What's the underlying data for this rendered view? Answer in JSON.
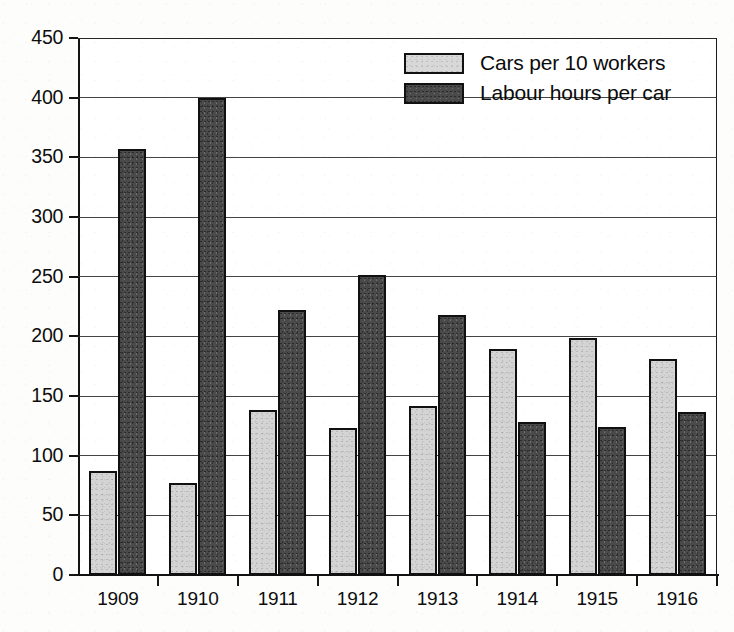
{
  "chart_data": {
    "type": "bar",
    "title": "",
    "subtitle": "",
    "xlabel": "",
    "ylabel": "",
    "categories": [
      "1909",
      "1910",
      "1911",
      "1912",
      "1913",
      "1914",
      "1915",
      "1916"
    ],
    "series": [
      {
        "name": "Cars per 10 workers",
        "color": "#d4d4d4",
        "values": [
          87,
          77,
          138,
          123,
          142,
          189,
          199,
          181
        ]
      },
      {
        "name": "Labour hours per car",
        "color": "#4a4a4a",
        "values": [
          357,
          400,
          222,
          251,
          218,
          128,
          124,
          137
        ]
      }
    ],
    "ylim": [
      0,
      450
    ],
    "ytick_values": [
      0,
      50,
      100,
      150,
      200,
      250,
      300,
      350,
      400,
      450
    ],
    "ytick_labels": [
      "0",
      "50",
      "100",
      "150",
      "200",
      "250",
      "300",
      "350",
      "400",
      "450"
    ],
    "grid": true,
    "legend_position": "top-right"
  },
  "legend": {
    "entries": [
      {
        "label": "Cars per 10 workers",
        "swatch": "light-gray-swatch"
      },
      {
        "label": "Labour hours per car",
        "swatch": "dark-gray-swatch"
      }
    ]
  },
  "axes": {
    "y_axis_name": "value-axis",
    "x_axis_name": "year-axis"
  }
}
